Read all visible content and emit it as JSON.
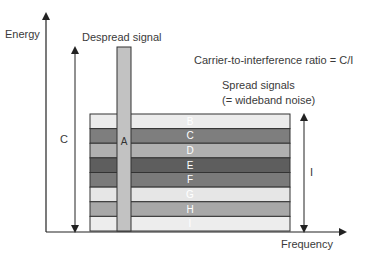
{
  "diagram": {
    "axes": {
      "y_label": "Energy",
      "x_label": "Frequency"
    },
    "despread": {
      "title": "Despread signal",
      "band_label": "A",
      "color": "#c2c2c2"
    },
    "ratio_text": "Carrier-to-interference ratio = C/I",
    "spread": {
      "title_line1": "Spread signals",
      "title_line2": "(= wideband noise)"
    },
    "arrows": {
      "carrier_label": "C",
      "interference_label": "I"
    },
    "bands": [
      {
        "label": "B",
        "color": "#ececec"
      },
      {
        "label": "C",
        "color": "#7e7e7e"
      },
      {
        "label": "D",
        "color": "#b0b0b0"
      },
      {
        "label": "E",
        "color": "#5e5e5e"
      },
      {
        "label": "F",
        "color": "#7a7a7a"
      },
      {
        "label": "G",
        "color": "#e6e6e6"
      },
      {
        "label": "H",
        "color": "#a8a8a8"
      },
      {
        "label": "I",
        "color": "#ededed"
      }
    ]
  }
}
